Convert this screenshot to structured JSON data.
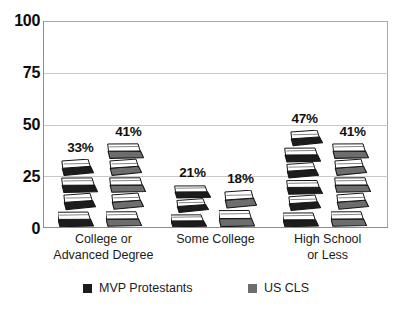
{
  "chart_data": {
    "type": "bar",
    "title": "",
    "subtitle": "",
    "xlabel": "",
    "ylabel": "",
    "ylim": [
      0,
      100
    ],
    "yticks": [
      0,
      25,
      50,
      75,
      100
    ],
    "ytick_labels": [
      "0",
      "25",
      "50",
      "75",
      "100"
    ],
    "grid": true,
    "grid_orientation": "horizontal",
    "legend_position": "bottom",
    "bar_style": "stack-of-books pictorial",
    "categories": [
      "College or\nAdvanced Degree",
      "Some College",
      "High School\nor Less"
    ],
    "category_lines": [
      [
        "College or",
        "Advanced Degree"
      ],
      [
        "Some College",
        ""
      ],
      [
        "High School",
        "or Less"
      ]
    ],
    "series": [
      {
        "name": "MVP Protestants",
        "color": "#1c1c1c",
        "values": [
          33,
          21,
          47
        ],
        "value_labels": [
          "33%",
          "21%",
          "47%"
        ]
      },
      {
        "name": "US CLS",
        "color": "#6d6d6d",
        "values": [
          41,
          18,
          41
        ],
        "value_labels": [
          "41%",
          "18%",
          "41%"
        ]
      }
    ]
  },
  "axis": {
    "ytick_labels": [
      "100",
      "75",
      "50",
      "25",
      "0"
    ]
  },
  "legend": {
    "entries": [
      {
        "label": "MVP Protestants",
        "color": "#1c1c1c"
      },
      {
        "label": "US CLS",
        "color": "#6d6d6d"
      }
    ]
  },
  "colors": {
    "series_dark": "#1c1c1c",
    "series_gray": "#6d6d6d",
    "gridline": "#c9c9c9",
    "axis": "#8d8d8d",
    "text": "#1b1b1b"
  }
}
